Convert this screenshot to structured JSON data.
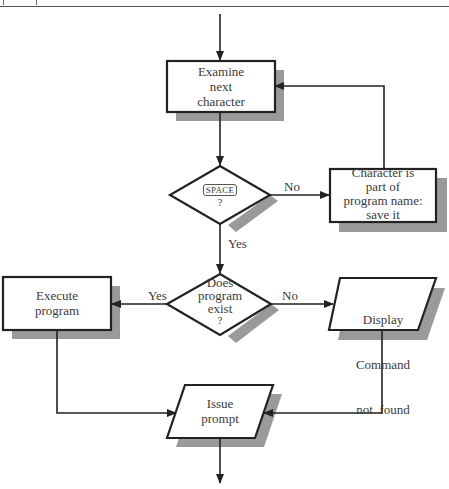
{
  "header": {
    "text": ""
  },
  "nodes": {
    "examine": {
      "type": "process",
      "label": "Examine next character",
      "lines": [
        "Examine",
        "next",
        "character"
      ]
    },
    "space_decision": {
      "type": "decision",
      "key": "SPACE",
      "question": "?"
    },
    "save_char": {
      "type": "process",
      "label": "Character is part of program name: save it",
      "lines": [
        "Character is",
        "part of",
        "program name:",
        "save it"
      ]
    },
    "exists_decision": {
      "type": "decision",
      "label": "Does program exist ?",
      "lines": [
        "Does",
        "program",
        "exist",
        "?"
      ]
    },
    "execute": {
      "type": "process",
      "label": "Execute program",
      "lines": [
        "Execute",
        "program"
      ]
    },
    "display": {
      "type": "io",
      "label": "Display Command not found",
      "lines": [
        "Display",
        "Command",
        "not  found"
      ]
    },
    "issue": {
      "type": "io",
      "label": "Issue prompt",
      "lines": [
        "Issue",
        "prompt"
      ]
    }
  },
  "edges": {
    "space_no": "No",
    "space_yes": "Yes",
    "exists_yes": "Yes",
    "exists_no": "No"
  },
  "colors": {
    "stroke": "#222222",
    "shadow": "#9a9a9a",
    "fill": "#ffffff"
  }
}
